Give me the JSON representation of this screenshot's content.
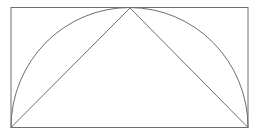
{
  "diagram": {
    "stroke_color": "#6e6e6e",
    "background": "#ffffff",
    "rectangle": {
      "x": 11,
      "y": 7.5,
      "width": 237,
      "height": 120
    },
    "semicircle": {
      "cx": 129.5,
      "cy": 127.5,
      "rx": 118.5,
      "ry": 120
    },
    "triangle": {
      "points": [
        [
          11,
          127.5
        ],
        [
          130,
          8
        ],
        [
          248,
          127.5
        ]
      ]
    }
  }
}
